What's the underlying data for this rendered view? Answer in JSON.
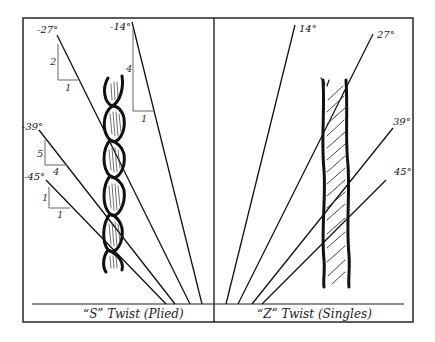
{
  "diagram": {
    "frame": {
      "x": 23,
      "y": 18,
      "width": 390,
      "height": 304,
      "baseline_y": 304,
      "divider_x": 214
    },
    "colors": {
      "stroke": "#111111",
      "triangle": "#555555",
      "background": "#ffffff"
    },
    "panels": [
      {
        "id": "s-twist",
        "caption": "“S” Twist (Plied)",
        "yarn_type": "plied",
        "angles": [
          {
            "label": "-27°",
            "x1": 57,
            "y1": 35,
            "x2": 190,
            "y2": 304,
            "rise": "2",
            "run": "1"
          },
          {
            "label": "-14°",
            "x1": 132,
            "y1": 22,
            "x2": 202,
            "y2": 304,
            "rise": "4",
            "run": "1"
          },
          {
            "label": "-39°",
            "x1": 39,
            "y1": 130,
            "x2": 175,
            "y2": 304,
            "rise": "5",
            "run": "4"
          },
          {
            "label": "-45°",
            "x1": 46,
            "y1": 180,
            "x2": 166,
            "y2": 304,
            "rise": "1",
            "run": "1"
          }
        ]
      },
      {
        "id": "z-twist",
        "caption": "“Z” Twist (Singles)",
        "yarn_type": "singles",
        "angles": [
          {
            "label": "14°",
            "x1": 295,
            "y1": 25,
            "x2": 226,
            "y2": 304
          },
          {
            "label": "27°",
            "x1": 373,
            "y1": 34,
            "x2": 238,
            "y2": 304
          },
          {
            "label": "39°",
            "x1": 393,
            "y1": 128,
            "x2": 252,
            "y2": 304
          },
          {
            "label": "45°",
            "x1": 386,
            "y1": 180,
            "x2": 262,
            "y2": 304
          }
        ]
      }
    ]
  },
  "labels": {
    "s_m27": "-27°",
    "s_m14": "-14°",
    "s_m39": "-39°",
    "s_m45": "-45°",
    "z_14": "14°",
    "z_27": "27°",
    "z_39": "39°",
    "z_45": "45°",
    "tri_27_rise": "2",
    "tri_27_run": "1",
    "tri_14_rise": "4",
    "tri_14_run": "1",
    "tri_39_rise": "5",
    "tri_39_run": "4",
    "tri_45_rise": "1",
    "tri_45_run": "1",
    "caption_s": "“S” Twist (Plied)",
    "caption_z": "“Z” Twist (Singles)"
  }
}
